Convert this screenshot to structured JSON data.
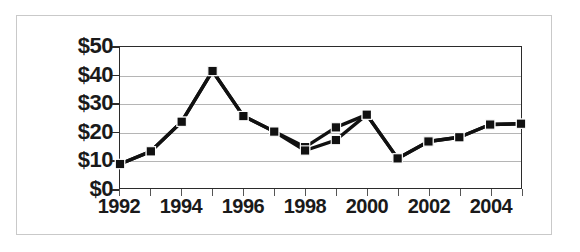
{
  "chart_data": {
    "type": "line",
    "title": "",
    "subtitle": "",
    "xlabel": "",
    "ylabel": "",
    "x": [
      1992,
      1993,
      1994,
      1995,
      1996,
      1997,
      1998,
      1999,
      2000,
      2001,
      2002,
      2003,
      2004,
      2005
    ],
    "xlim": [
      1992,
      2005
    ],
    "ylim": [
      0,
      50
    ],
    "y_tick_labels": [
      "$50",
      "$40",
      "$30",
      "$20",
      "$10",
      "$0"
    ],
    "y_tick_values": [
      50,
      40,
      30,
      20,
      10,
      0
    ],
    "x_tick_labels": [
      "1992",
      "1994",
      "1996",
      "1998",
      "2000",
      "2002",
      "2004"
    ],
    "x_tick_values": [
      1992,
      1994,
      1996,
      1998,
      2000,
      2002,
      2004
    ],
    "grid": "horizontal",
    "legend": "none",
    "marker": "filled-square",
    "line_color": "#111111",
    "marker_color": "#111111",
    "grid_color": "#b5b5b5",
    "axis_color": "#2b2b2b",
    "series": [
      {
        "name": "series-1",
        "values": [
          8.5,
          13.0,
          23.5,
          41.5,
          25.5,
          20.0,
          14.5,
          21.5,
          26.0,
          10.5,
          16.5,
          18.0,
          22.5,
          22.8
        ]
      },
      {
        "name": "series-2",
        "values": [
          8.5,
          13.0,
          23.5,
          41.5,
          25.5,
          20.0,
          13.3,
          17.0,
          26.0,
          10.5,
          16.5,
          18.0,
          22.5,
          22.8
        ]
      }
    ]
  },
  "frame": {
    "border_color": "#c9c9c9"
  }
}
